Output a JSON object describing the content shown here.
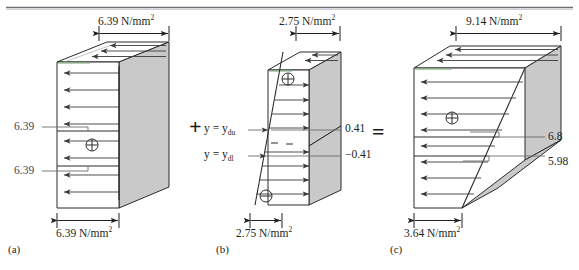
{
  "figure": {
    "type": "engineering-stress-diagram",
    "top_rule": true,
    "operators": [
      {
        "symbol": "+",
        "x": 195,
        "y": 128
      },
      {
        "symbol": "=",
        "x": 378,
        "y": 133
      }
    ],
    "panels": [
      {
        "id": "a",
        "id_label": "(a)",
        "distribution": "uniform",
        "top_dim_label": "6.39 N/mm",
        "top_dim_sup": "2",
        "bottom_dim_label": "6.39 N/mm",
        "bottom_dim_sup": "2",
        "sign_symbol": "⊕",
        "side_labels": [
          {
            "text": "6.39",
            "y": 127
          },
          {
            "text": "6.39",
            "y": 171
          }
        ]
      },
      {
        "id": "b",
        "id_label": "(b)",
        "distribution": "linear-bending",
        "top_dim_label": "2.75 N/mm",
        "top_dim_sup": "2",
        "bottom_dim_label": "2.75 N/mm",
        "bottom_dim_sup": "2",
        "sign_symbol_top": "⊕",
        "sign_symbol_bottom": "⊖",
        "axis_labels": [
          {
            "text": "y = y",
            "sub": "du",
            "y": 128
          },
          {
            "text": "y = y",
            "sub": "dl",
            "y": 152
          }
        ],
        "value_labels": [
          {
            "text": "0.41",
            "y": 128
          },
          {
            "text": "−0.41",
            "y": 155
          }
        ],
        "minus_marks": [
          "−",
          "−"
        ]
      },
      {
        "id": "c",
        "id_label": "(c)",
        "distribution": "trapezoidal",
        "top_dim_label": "9.14 N/mm",
        "top_dim_sup": "2",
        "bottom_dim_label": "3.64 N/mm",
        "bottom_dim_sup": "2",
        "sign_symbol": "⊕",
        "value_labels": [
          {
            "text": "6.8",
            "y": 136
          },
          {
            "text": "5.98",
            "y": 161
          }
        ]
      }
    ],
    "colors": {
      "block_face": "#c9c9c9",
      "outline": "#2b2b2b",
      "arrow": "#3a3a3a",
      "leader": "#6b6b6b",
      "label_blue": "#3d4652",
      "green_edge": "#8fbf8f",
      "rule": "#6f6f77"
    }
  }
}
